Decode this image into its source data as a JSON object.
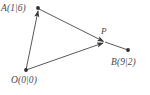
{
  "figure": {
    "type": "vector-geometry-diagram",
    "background_color": "#ffffff",
    "stroke_color": "#3a3a3a",
    "label_color": "#4a4a4a",
    "width": 150,
    "height": 95,
    "points": [
      {
        "id": "A",
        "label": "A(1|6)",
        "coords": "1|6",
        "x": 38,
        "y": 8,
        "marker": true
      },
      {
        "id": "O",
        "label": "O(0|0)",
        "coords": "0|0",
        "x": 26,
        "y": 70,
        "marker": true
      },
      {
        "id": "B",
        "label": "B(9|2)",
        "coords": "9|2",
        "x": 128,
        "y": 50,
        "marker": true
      },
      {
        "id": "P",
        "label": "P",
        "coords": "",
        "x": 105,
        "y": 42,
        "marker": false
      }
    ],
    "segments": [
      {
        "id": "O-A",
        "from": "O",
        "to": "A",
        "arrow_at_end": true
      },
      {
        "id": "A-P",
        "from": "A",
        "to": "P",
        "arrow_at_end": true
      },
      {
        "id": "P-B",
        "from": "P",
        "to": "B",
        "arrow_at_end": false
      },
      {
        "id": "O-P",
        "from": "O",
        "to": "P",
        "arrow_at_end": true
      }
    ]
  }
}
